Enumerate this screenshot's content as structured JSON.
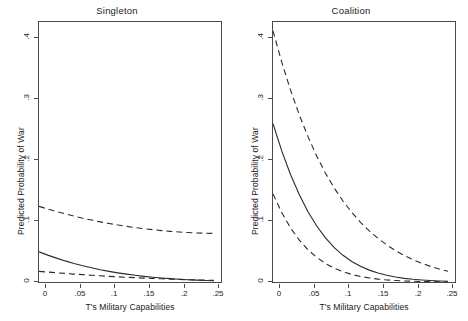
{
  "figure": {
    "width": 468,
    "height": 321,
    "background": "#ffffff",
    "line_color": "#2b2b2b",
    "axis_color": "#4a4a4a"
  },
  "chart_data": [
    {
      "type": "line",
      "title": "Singleton",
      "xlabel": "T's Military Capabilities",
      "ylabel": "Predicted Probability of War",
      "xlim": [
        0,
        0.26
      ],
      "ylim": [
        0,
        0.44
      ],
      "xticks": [
        0,
        0.05,
        0.1,
        0.15,
        0.2,
        0.25
      ],
      "xticklabels": [
        "0",
        ".05",
        ".1",
        ".15",
        ".2",
        ".25"
      ],
      "yticks": [
        0,
        0.1,
        0.2,
        0.3,
        0.4
      ],
      "yticklabels": [
        "0",
        ".1",
        ".2",
        ".3",
        ".4"
      ],
      "grid": false,
      "legend": "none",
      "x": [
        0,
        0.0125,
        0.025,
        0.0375,
        0.05,
        0.0625,
        0.075,
        0.0875,
        0.1,
        0.1125,
        0.125,
        0.1375,
        0.15,
        0.1625,
        0.175,
        0.1875,
        0.2,
        0.2125,
        0.225,
        0.2375,
        0.25
      ],
      "series": [
        {
          "name": "upper 95% confidence bound",
          "style": "dashed",
          "values": [
            0.128,
            0.1235,
            0.1192,
            0.1152,
            0.1115,
            0.108,
            0.1048,
            0.1018,
            0.099,
            0.0965,
            0.0942,
            0.0921,
            0.0902,
            0.0885,
            0.087,
            0.0857,
            0.0846,
            0.0837,
            0.083,
            0.0825,
            0.0822
          ]
        },
        {
          "name": "predicted probability",
          "style": "solid",
          "values": [
            0.051,
            0.0455,
            0.0404,
            0.0357,
            0.0314,
            0.0275,
            0.024,
            0.0208,
            0.018,
            0.0155,
            0.0133,
            0.0113,
            0.0096,
            0.0081,
            0.0068,
            0.0057,
            0.0047,
            0.0039,
            0.0032,
            0.0026,
            0.0022
          ]
        },
        {
          "name": "lower 95% confidence bound",
          "style": "dashed",
          "values": [
            0.018,
            0.0168,
            0.0156,
            0.0145,
            0.0134,
            0.0124,
            0.0114,
            0.0105,
            0.0096,
            0.0088,
            0.008,
            0.0073,
            0.0066,
            0.006,
            0.0054,
            0.0049,
            0.0044,
            0.0039,
            0.0035,
            0.0031,
            0.0028
          ]
        }
      ]
    },
    {
      "type": "line",
      "title": "Coalition",
      "xlabel": "T's Military Capabilities",
      "ylabel": "Predicted Probability of War",
      "xlim": [
        0,
        0.26
      ],
      "ylim": [
        0,
        0.44
      ],
      "xticks": [
        0,
        0.05,
        0.1,
        0.15,
        0.2,
        0.25
      ],
      "xticklabels": [
        "0",
        ".05",
        ".1",
        ".15",
        ".2",
        ".25"
      ],
      "yticks": [
        0,
        0.1,
        0.2,
        0.3,
        0.4
      ],
      "yticklabels": [
        "0",
        ".1",
        ".2",
        ".3",
        ".4"
      ],
      "grid": false,
      "legend": "none",
      "x": [
        0,
        0.0125,
        0.025,
        0.0375,
        0.05,
        0.0625,
        0.075,
        0.0875,
        0.1,
        0.1125,
        0.125,
        0.1375,
        0.15,
        0.1625,
        0.175,
        0.1875,
        0.2,
        0.2125,
        0.225,
        0.2375,
        0.25
      ],
      "series": [
        {
          "name": "upper 95% confidence bound",
          "style": "dashed",
          "values": [
            0.425,
            0.372,
            0.325,
            0.283,
            0.246,
            0.213,
            0.184,
            0.159,
            0.137,
            0.118,
            0.101,
            0.0865,
            0.0738,
            0.0628,
            0.0532,
            0.0449,
            0.0378,
            0.0317,
            0.0264,
            0.0219,
            0.0182
          ]
        },
        {
          "name": "predicted probability",
          "style": "solid",
          "values": [
            0.268,
            0.222,
            0.182,
            0.148,
            0.119,
            0.0947,
            0.0746,
            0.0583,
            0.0452,
            0.0347,
            0.0265,
            0.0201,
            0.0151,
            0.0113,
            0.0084,
            0.0062,
            0.0046,
            0.0034,
            0.0025,
            0.0018,
            0.0013
          ]
        },
        {
          "name": "lower 95% confidence bound",
          "style": "dashed",
          "values": [
            0.149,
            0.1175,
            0.0917,
            0.071,
            0.0545,
            0.0415,
            0.0313,
            0.0234,
            0.0174,
            0.0128,
            0.0094,
            0.0068,
            0.0049,
            0.0035,
            0.0025,
            0.0018,
            0.0013,
            0.0009,
            0.00065,
            0.00045,
            0.0003
          ]
        }
      ]
    }
  ]
}
